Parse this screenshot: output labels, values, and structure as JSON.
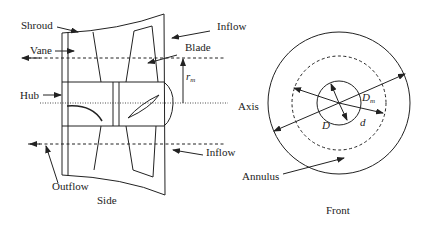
{
  "side_view": {
    "caption": "Side",
    "labels": {
      "shroud": "Shroud",
      "vane": "Vane",
      "hub": "Hub",
      "outflow": "Outflow",
      "inflow_top": "Inflow",
      "inflow_bottom": "Inflow",
      "blade": "Blade",
      "rm_symbol": "r",
      "rm_subscript": "m"
    }
  },
  "front_view": {
    "caption": "Front",
    "labels": {
      "axis": "Axis",
      "annulus": "Annulus",
      "D": "D",
      "d": "d",
      "Dm_symbol": "D",
      "Dm_subscript": "m"
    }
  },
  "colors": {
    "line": "#222222",
    "background": "#ffffff"
  }
}
